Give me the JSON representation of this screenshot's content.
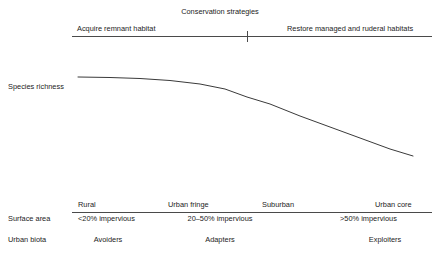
{
  "figure": {
    "background_color": "#ffffff",
    "line_color": "#4a4a4a",
    "text_color": "#232323"
  },
  "conservation_axis": {
    "title": "Conservation strategies",
    "left_label": "Acquire remnant habitat",
    "right_label": "Restore managed and ruderal habitats",
    "divider_tick": true
  },
  "y_axis": {
    "label": "Species richness"
  },
  "gradient_table": {
    "column_headers": [
      "Rural",
      "Urban fringe",
      "Suburban",
      "Urban core"
    ],
    "rows": [
      {
        "label": "Surface area",
        "values": [
          "<20% impervious",
          "20–50% impervious",
          ">50% impervious"
        ]
      },
      {
        "label": "Urban biota",
        "values": [
          "Avoiders",
          "Adapters",
          "Exploiters"
        ]
      }
    ]
  },
  "chart_data": {
    "type": "line",
    "title": "",
    "xlabel": "",
    "ylabel": "Species richness",
    "x": [
      78,
      110,
      140,
      170,
      200,
      225,
      247,
      270,
      300,
      330,
      360,
      390,
      413
    ],
    "y": [
      77,
      77.5,
      78.5,
      80.5,
      84,
      89,
      97,
      104,
      116,
      127,
      138,
      149,
      156
    ],
    "xlim": [
      72,
      432
    ],
    "ylim": [
      160,
      70
    ],
    "grid": false,
    "legend": null,
    "line_color": "#3a3a3a"
  }
}
